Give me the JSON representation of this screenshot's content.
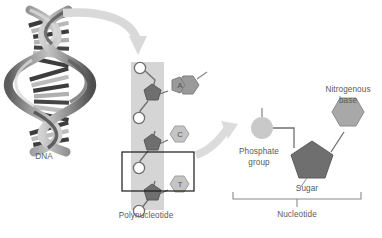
{
  "figure": {
    "title_visible": false,
    "background": "#ffffff"
  },
  "labels": {
    "dna": "DNA",
    "polynucleotide": "Polynucleotide",
    "phosphate_group_line1": "Phosphate",
    "phosphate_group_line2": "group",
    "nitrogenous_base_line1": "Nitrogenous",
    "nitrogenous_base_line2": "base",
    "sugar": "Sugar",
    "nucleotide": "Nucleotide"
  },
  "bases": {
    "adenine": "A",
    "cytosine": "C",
    "thymine": "T"
  },
  "colors": {
    "helix_dark": "#4a4a4a",
    "helix_mid": "#8f8f8f",
    "helix_light": "#cfcfcf",
    "band_gray": "#d5d5d5",
    "phosphate_circle": "#ffffff",
    "phosphate_circle_large": "#c9c9c9",
    "sugar_pentagon": "#6f6f6f",
    "base_purine": "#9a9a9a",
    "base_pyrimidine": "#c4c4c4",
    "base_right": "#a8a8a8",
    "arrow_gray": "#d9d9d9",
    "box_outline": "#1a1a1a",
    "text": "#5a5a5a",
    "leader_line": "#8a8a8a"
  },
  "structure": {
    "left_panel": "DNA double helix",
    "middle_panel": "Polynucleotide strand with sugar-phosphate backbone",
    "right_panel": "Single nucleotide magnified",
    "arrows": 2,
    "selection_boxes": 1,
    "bracket": "nucleotide-bracket"
  }
}
